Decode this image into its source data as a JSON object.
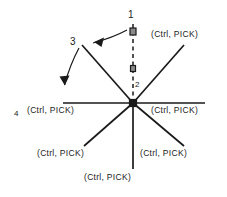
{
  "figure": {
    "type": "line-diagram",
    "background_color": "#ffffff",
    "line_color": "#1a1a1a",
    "marker_fill": "#7a7a7a",
    "marker_stroke": "#1a1a1a"
  },
  "callouts": [
    {
      "id": "callout-1",
      "label": "1",
      "x": 128,
      "y": 10
    },
    {
      "id": "callout-2",
      "label": "2",
      "x": 135,
      "y": 82
    },
    {
      "id": "callout-3",
      "label": "3",
      "x": 70,
      "y": 37
    },
    {
      "id": "callout-4",
      "label": "4",
      "x": 14,
      "y": 110
    }
  ],
  "pick_labels": [
    {
      "id": "pick-top-right",
      "text": "(Ctrl, PICK)",
      "x": 151,
      "y": 33
    },
    {
      "id": "pick-mid-right",
      "text": "(Ctrl, PICK)",
      "x": 151,
      "y": 105
    },
    {
      "id": "pick-mid-left",
      "text": "(Ctrl, PICK)",
      "x": 27,
      "y": 110
    },
    {
      "id": "pick-bottom-left",
      "text": "(Ctrl, PICK)",
      "x": 37,
      "y": 151
    },
    {
      "id": "pick-bottom-right",
      "text": "(Ctrl, PICK)",
      "x": 140,
      "y": 151
    },
    {
      "id": "pick-bottom",
      "text": "(Ctrl, PICK)",
      "x": 84,
      "y": 174
    }
  ],
  "geometry": {
    "center": {
      "x": 133,
      "y": 103
    },
    "rays": [
      {
        "id": "ray-horizontal-left",
        "x1": 63,
        "y1": 103,
        "x2": 133,
        "y2": 103
      },
      {
        "id": "ray-horizontal-right",
        "x1": 133,
        "y1": 103,
        "x2": 205,
        "y2": 103
      },
      {
        "id": "ray-vertical-down",
        "x1": 133,
        "y1": 103,
        "x2": 133,
        "y2": 169
      },
      {
        "id": "ray-upper-right",
        "x1": 133,
        "y1": 103,
        "x2": 184,
        "y2": 45
      },
      {
        "id": "ray-upper-left",
        "x1": 133,
        "y1": 103,
        "x2": 82,
        "y2": 45
      },
      {
        "id": "ray-lower-left",
        "x1": 133,
        "y1": 103,
        "x2": 84,
        "y2": 146
      },
      {
        "id": "ray-lower-right",
        "x1": 133,
        "y1": 103,
        "x2": 184,
        "y2": 146
      }
    ],
    "dashed_line": {
      "id": "dashed-vertical",
      "x1": 133,
      "y1": 24,
      "x2": 133,
      "y2": 101
    },
    "markers": [
      {
        "id": "marker-top",
        "x": 133,
        "y": 31,
        "size": 6
      },
      {
        "id": "marker-middle",
        "x": 133,
        "y": 68,
        "size": 5
      },
      {
        "id": "marker-center",
        "x": 133,
        "y": 103,
        "size": 7
      }
    ],
    "arrows": [
      {
        "id": "arrow-upper",
        "path": "M 127 30 C 115 36 103 40 92 43",
        "tip": "M 92 43 L 101 38 L 99 47 Z"
      },
      {
        "id": "arrow-lower",
        "path": "M 79 48 C 73 60 68 74 65 85",
        "tip": "M 65 85 L 69 75 L 60 76 Z"
      }
    ]
  }
}
